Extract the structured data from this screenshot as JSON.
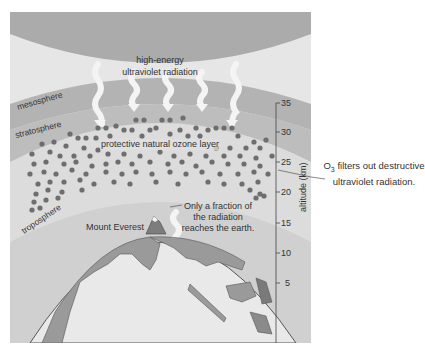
{
  "figure": {
    "top_label_line1": "high-energy",
    "top_label_line2": "ultraviolet radiation",
    "layers": {
      "mesosphere": "mesosphere",
      "stratosphere": "stratosphere",
      "troposphere": "troposphere"
    },
    "ozone_label": "protective natural ozone layer",
    "fraction_line1": "Only a fraction of",
    "fraction_line2": "the radiation",
    "fraction_line3": "reaches the earth.",
    "everest_label": "Mount Everest",
    "axis": {
      "title": "altitude (km)",
      "ticks": [
        "35",
        "30",
        "25",
        "20",
        "15",
        "10",
        "5"
      ]
    },
    "callout": {
      "prefix": "O",
      "subscript": "3",
      "line1_rest": " filters out destructive",
      "line2": "ultraviolet radiation."
    },
    "colors": {
      "space": "#a9a9a9",
      "upper_air": "#e8e8e8",
      "mesosphere_band": "#b4b4b4",
      "stratosphere_band": "#dedede",
      "ozone_dot": "#6e6e6e",
      "troposphere": "#d2d2d2",
      "land": "#9a9a9a",
      "ocean": "#e9e9e9"
    }
  }
}
